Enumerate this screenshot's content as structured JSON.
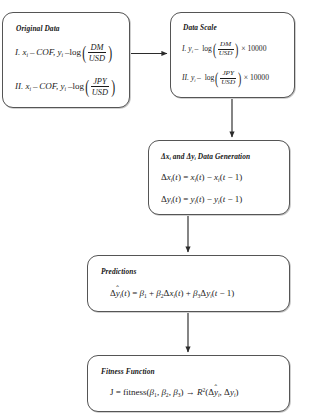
{
  "diagram": {
    "background_color": "#ffffff",
    "line_color": "#2b2b2b",
    "box_border_color": "#555555"
  },
  "nodes": {
    "original_data": {
      "title": "Original Data",
      "items": [
        {
          "label": "I.",
          "lhs_x": "x",
          "dash_1": "–",
          "x_def": "COF,",
          "lhs_y": "y",
          "dash_2": "–",
          "fn": "log",
          "numerator": "DM",
          "denominator": "USD"
        },
        {
          "label": "II.",
          "lhs_x": "x",
          "dash_1": "–",
          "x_def": "COF,",
          "lhs_y": "y",
          "dash_2": "–",
          "fn": "log",
          "numerator": "JPY",
          "denominator": "USD"
        }
      ]
    },
    "data_scale": {
      "title": "Data Scale",
      "items": [
        {
          "label": "I.",
          "lhs_y": "y",
          "dash": "–",
          "fn": "log",
          "numerator": "DM",
          "denominator": "USD",
          "times": "×",
          "multiplier": "10000"
        },
        {
          "label": "II.",
          "lhs_y": "y",
          "dash": "–",
          "fn": "log",
          "numerator": "JPY",
          "denominator": "USD",
          "times": "×",
          "multiplier": "10000"
        }
      ]
    },
    "delta_generation": {
      "title_part_1": "Δx",
      "title_part_2": "and",
      "title_part_3": "Δy",
      "title_part_4": "Data Generation",
      "equation_1": "Δx",
      "equation_1_full": "Δxᵢ(t) = xᵢ(t) − xᵢ(t − 1)",
      "equation_2_full": "Δyᵢ(t) = yᵢ(t) − yᵢ(t − 1)"
    },
    "predictions": {
      "title": "Predictions",
      "equation": "Δŷᵢ(t) = β₁ + β₂Δxᵢ(t) + β₃Δyᵢ(t − 1)"
    },
    "fitness_function": {
      "title": "Fitness Function",
      "equation": "J = fitness(β₁, β₂, β₃) → R²(Δŷᵢ, Δyᵢ)"
    }
  },
  "symbols": {
    "delta": "Δ",
    "beta": "β",
    "minus": "−",
    "dash": "–",
    "times": "×",
    "arrow_right": "→",
    "equals": "=",
    "plus": "+",
    "paren_open": "(",
    "paren_close": ")",
    "subscript_i": "i",
    "var_t": "t",
    "var_x": "x",
    "var_y": "y",
    "one": "1",
    "fitness_word": "fitness",
    "log_word": "log",
    "J": "J",
    "R": "R",
    "R_exponent": "2",
    "beta_1": "1",
    "beta_2": "2",
    "beta_3": "3",
    "hat": "ˆ"
  },
  "connectors": [
    {
      "name": "original-data-to-data-scale",
      "direction": "right"
    },
    {
      "name": "data-scale-to-delta-generation",
      "direction": "down"
    },
    {
      "name": "delta-generation-to-predictions",
      "direction": "down"
    },
    {
      "name": "predictions-to-fitness-function",
      "direction": "down"
    }
  ]
}
